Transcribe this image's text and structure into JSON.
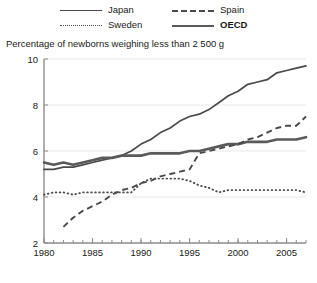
{
  "chart_title": "Percentage of newborns weighing less than 2 500 g",
  "legend": {
    "position": "top",
    "entries": [
      {
        "label": "Japan",
        "style": "solid",
        "bold": false,
        "icon": "line-solid-icon"
      },
      {
        "label": "Spain",
        "style": "dashed",
        "bold": false,
        "icon": "line-dashed-icon"
      },
      {
        "label": "Sweden",
        "style": "dotted",
        "bold": false,
        "icon": "line-dotted-icon"
      },
      {
        "label": "OECD",
        "style": "thick",
        "bold": true,
        "icon": "line-thick-icon"
      }
    ]
  },
  "axes": {
    "y_ticks": [
      "10",
      "8",
      "6",
      "4",
      "2"
    ],
    "x_ticks": [
      "1980",
      "1985",
      "1990",
      "1995",
      "2000",
      "2005"
    ]
  },
  "chart_data": {
    "type": "line",
    "title": "Percentage of newborns weighing less than 2 500 g",
    "xlabel": "",
    "ylabel": "",
    "xlim": [
      1980,
      2007
    ],
    "ylim": [
      2,
      10
    ],
    "ytick_values": [
      2,
      4,
      6,
      8,
      10
    ],
    "xtick_values": [
      1980,
      1985,
      1990,
      1995,
      2000,
      2005
    ],
    "grid": false,
    "legend_position": "top",
    "x": [
      1980,
      1981,
      1982,
      1983,
      1984,
      1985,
      1986,
      1987,
      1988,
      1989,
      1990,
      1991,
      1992,
      1993,
      1994,
      1995,
      1996,
      1997,
      1998,
      1999,
      2000,
      2001,
      2002,
      2003,
      2004,
      2005,
      2006,
      2007
    ],
    "series": [
      {
        "name": "Japan",
        "style": "solid",
        "values": [
          5.2,
          5.2,
          5.3,
          5.3,
          5.4,
          5.5,
          5.6,
          5.7,
          5.8,
          6.0,
          6.3,
          6.5,
          6.8,
          7.0,
          7.3,
          7.5,
          7.6,
          7.8,
          8.1,
          8.4,
          8.6,
          8.9,
          9.0,
          9.1,
          9.4,
          9.5,
          9.6,
          9.7
        ]
      },
      {
        "name": "Spain",
        "style": "dashed",
        "values": [
          null,
          null,
          2.7,
          3.1,
          3.4,
          3.6,
          3.8,
          4.1,
          4.3,
          4.4,
          4.6,
          4.7,
          4.9,
          5.0,
          5.1,
          5.2,
          5.9,
          6.0,
          6.1,
          6.2,
          6.3,
          6.5,
          6.6,
          6.8,
          7.0,
          7.1,
          7.1,
          7.5
        ]
      },
      {
        "name": "Sweden",
        "style": "dotted",
        "values": [
          4.1,
          4.2,
          4.2,
          4.1,
          4.2,
          4.2,
          4.2,
          4.2,
          4.2,
          4.2,
          4.6,
          4.8,
          4.8,
          4.8,
          4.8,
          4.7,
          4.5,
          4.4,
          4.2,
          4.3,
          4.3,
          4.3,
          4.3,
          4.3,
          4.3,
          4.3,
          4.3,
          4.2
        ]
      },
      {
        "name": "OECD",
        "style": "thick",
        "values": [
          5.5,
          5.4,
          5.5,
          5.4,
          5.5,
          5.6,
          5.7,
          5.7,
          5.8,
          5.8,
          5.8,
          5.9,
          5.9,
          5.9,
          5.9,
          6.0,
          6.0,
          6.1,
          6.2,
          6.3,
          6.3,
          6.4,
          6.4,
          6.4,
          6.5,
          6.5,
          6.5,
          6.6
        ]
      }
    ]
  }
}
